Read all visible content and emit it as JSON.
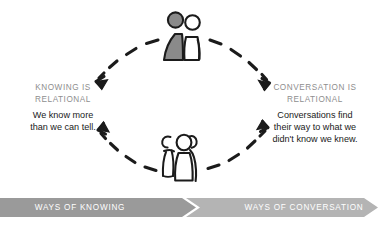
{
  "diagram": {
    "title_left": "KNOWING IS\nRELATIONAL",
    "title_right": "CONVERSATION IS\nRELATIONAL",
    "body_left": "We know more\nthan we can tell.",
    "body_right": "Conversations find\ntheir way to what we\ndidn't know we knew.",
    "banner_left": "Ways of Knowing",
    "banner_right": "Ways of Conversation",
    "colors": {
      "heading": "#8e8e8e",
      "body": "#1a1a1a",
      "banner_left_fill": "#9a9a9a",
      "banner_right_fill": "#b4b4b4",
      "banner_label": "#ffffff",
      "ink": "#1b1b1b",
      "figure_shaded": "#8a8a8a"
    },
    "figures": {
      "top_group_label": "two-people-group",
      "top_group_count": 2,
      "bottom_group_label": "three-people-group",
      "bottom_group_count": 3
    },
    "arrows": [
      {
        "name": "arrow-top-left",
        "direction": "down-left",
        "style": "dashed-curved"
      },
      {
        "name": "arrow-top-right",
        "direction": "down-right",
        "style": "dashed-curved"
      },
      {
        "name": "arrow-bottom-left",
        "direction": "up-left",
        "style": "dashed-curved"
      },
      {
        "name": "arrow-bottom-right",
        "direction": "up-right",
        "style": "dashed-curved"
      }
    ]
  }
}
